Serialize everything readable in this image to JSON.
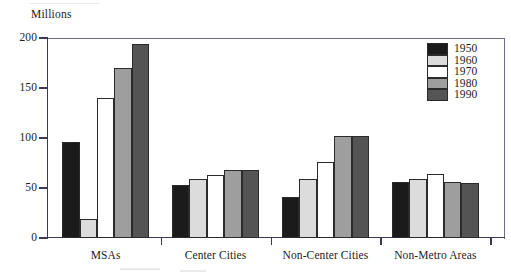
{
  "chart_data": {
    "type": "bar",
    "title": "",
    "subtitle": "",
    "xlabel": "",
    "ylabel": "Millions",
    "unit_label": "Millions",
    "categories": [
      "MSAs",
      "Center Cities",
      "Non-Center Cities",
      "Non-Metro Areas"
    ],
    "series": [
      {
        "name": "1950",
        "color": "#1b1b1b",
        "values": [
          96,
          53,
          41,
          56
        ]
      },
      {
        "name": "1960",
        "color": "#dcdcdc",
        "values": [
          19,
          59,
          59,
          59
        ]
      },
      {
        "name": "1970",
        "color": "#ffffff",
        "values": [
          140,
          63,
          76,
          64
        ]
      },
      {
        "name": "1980",
        "color": "#9e9e9e",
        "values": [
          170,
          68,
          102,
          56
        ]
      },
      {
        "name": "1990",
        "color": "#545454",
        "values": [
          194,
          68,
          102,
          55
        ]
      }
    ],
    "ylim": [
      0,
      200
    ],
    "yticks": [
      0,
      50,
      100,
      150,
      200
    ],
    "ytick_labels": [
      "0",
      "50",
      "100",
      "150",
      "200"
    ],
    "grid": false,
    "legend_position": "top-right",
    "legend_entries": [
      "1950",
      "1960",
      "1970",
      "1980",
      "1990"
    ]
  },
  "axis": {
    "unit_label": "Millions",
    "ytick_labels": [
      "200",
      "150",
      "100",
      "50",
      "0"
    ]
  },
  "legend": {
    "entries": [
      {
        "label": "1950"
      },
      {
        "label": "1960"
      },
      {
        "label": "1970"
      },
      {
        "label": "1980"
      },
      {
        "label": "1990"
      }
    ]
  },
  "categories": [
    {
      "label": "MSAs"
    },
    {
      "label": "Center Cities"
    },
    {
      "label": "Non-Center Cities"
    },
    {
      "label": "Non-Metro Areas"
    }
  ],
  "colors": {
    "y1950": "#1b1b1b",
    "y1960": "#dcdcdc",
    "y1970": "#ffffff",
    "y1980": "#9e9e9e",
    "y1990": "#545454",
    "axis": "#3a3a52",
    "text": "#1c1c1c"
  }
}
